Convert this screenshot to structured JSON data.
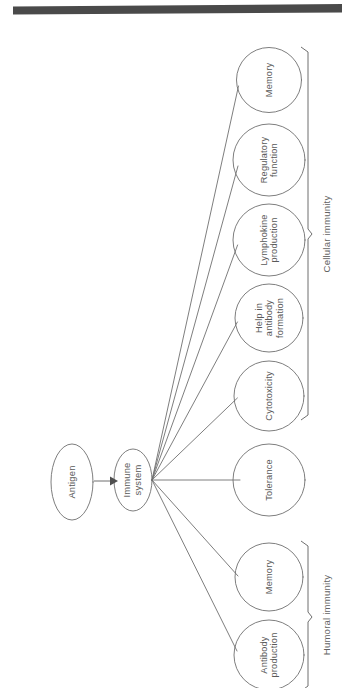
{
  "diagram": {
    "type": "flowchart",
    "orientation": "rotated-90",
    "colors": {
      "stroke": "#6f6f6f",
      "text": "#5a5a5a",
      "background": "#ffffff",
      "topbar": "#4a4a4a"
    },
    "topbar": {
      "name": "page-header-rule"
    },
    "sources": [
      {
        "id": "antigen",
        "label": "Antigen",
        "shape": "ellipse"
      },
      {
        "id": "immune-system",
        "label": "Immune\nsystem",
        "label_line1": "Immune",
        "label_line2": "system",
        "shape": "ellipse"
      }
    ],
    "arrow": {
      "from": "antigen",
      "to": "immune-system",
      "style": "solid-arrowhead"
    },
    "outcomes": [
      {
        "id": "memory-cellular",
        "label": "Memory",
        "group": "cellular"
      },
      {
        "id": "regulatory-function",
        "label_line1": "Regulatory",
        "label_line2": "function",
        "label": "Regulatory function",
        "group": "cellular"
      },
      {
        "id": "lymphokine-production",
        "label_line1": "Lymphokine",
        "label_line2": "production",
        "label": "Lymphokine production",
        "group": "cellular"
      },
      {
        "id": "help-in-antibody-formation",
        "label_line1": "Help in",
        "label_line2": "antibody",
        "label_line3": "formation",
        "label": "Help in antibody formation",
        "group": "cellular"
      },
      {
        "id": "cytotoxicity",
        "label": "Cytotoxicity",
        "group": "cellular"
      },
      {
        "id": "tolerance",
        "label": "Tolerance",
        "group": "none"
      },
      {
        "id": "memory-humoral",
        "label": "Memory",
        "group": "humoral"
      },
      {
        "id": "antibody-production",
        "label_line1": "Antibody",
        "label_line2": "production",
        "label": "Antibody production",
        "group": "humoral"
      }
    ],
    "groups": [
      {
        "id": "cellular",
        "label": "Cellular immunity"
      },
      {
        "id": "humoral",
        "label": "Humoral immunity"
      }
    ]
  }
}
